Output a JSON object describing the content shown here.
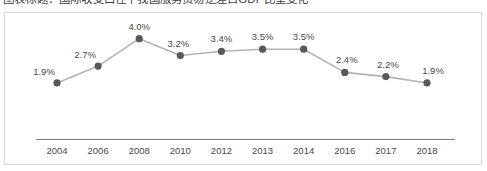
{
  "title": "图表标题：国际收支口径下我国服务贸易逆差占GDP比重变化",
  "chart_data": {
    "type": "line",
    "title": "",
    "xlabel": "",
    "ylabel": "",
    "categories": [
      "2004",
      "2006",
      "2008",
      "2010",
      "2012",
      "2013",
      "2014",
      "2016",
      "2017",
      "2018"
    ],
    "values": [
      1.9,
      2.7,
      4.0,
      3.2,
      3.4,
      3.5,
      3.5,
      2.4,
      2.2,
      1.9
    ],
    "data_labels": [
      "1.9%",
      "2.7%",
      "4.0%",
      "3.2%",
      "3.4%",
      "3.5%",
      "3.5%",
      "2.4%",
      "2.2%",
      "1.9%"
    ],
    "ylim": [
      0,
      4.6
    ],
    "grid": false,
    "legend": null,
    "series": [
      {
        "name": "占比",
        "values": [
          1.9,
          2.7,
          4.0,
          3.2,
          3.4,
          3.5,
          3.5,
          2.4,
          2.2,
          1.9
        ]
      }
    ],
    "colors": {
      "line": "#b3b3b3",
      "marker": "#595959",
      "axis": "#808080",
      "label_text": "#4a4a4a",
      "frame": "#d9d9d9",
      "background": "#ffffff"
    }
  }
}
